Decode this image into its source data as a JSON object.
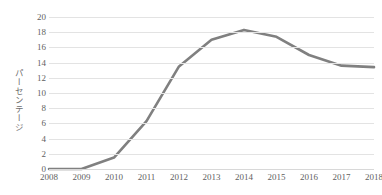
{
  "chart_data": {
    "type": "line",
    "title": "",
    "subtitle": "",
    "xlabel": "",
    "ylabel": "パーセンテージ",
    "x": [
      2008,
      2009,
      2010,
      2011,
      2012,
      2013,
      2014,
      2015,
      2016,
      2017,
      2018
    ],
    "categories": [
      "2008",
      "2009",
      "2010",
      "2011",
      "2012",
      "2013",
      "2014",
      "2015",
      "2016",
      "2017",
      "2018"
    ],
    "values": [
      0.0,
      0.0,
      1.5,
      6.3,
      13.5,
      17.0,
      18.3,
      17.4,
      15.0,
      13.6,
      13.4
    ],
    "series": [
      {
        "name": "パーセンテージ",
        "color": "#808080",
        "values": [
          0.0,
          0.0,
          1.5,
          6.3,
          13.5,
          17.0,
          18.3,
          17.4,
          15.0,
          13.6,
          13.4
        ]
      }
    ],
    "ylim": [
      0,
      20
    ],
    "ytick_step": 2,
    "ytick_labels": [
      "0",
      "2",
      "4",
      "6",
      "8",
      "10",
      "12",
      "14",
      "16",
      "18",
      "20"
    ],
    "ytick_values": [
      0,
      2,
      4,
      6,
      8,
      10,
      12,
      14,
      16,
      18,
      20
    ],
    "xtick_labels": [
      "2008",
      "2009",
      "2010",
      "2011",
      "2012",
      "2013",
      "2014",
      "2015",
      "2016",
      "2017",
      "2018"
    ],
    "grid": "horizontal",
    "grid_color": "#e3e3e3",
    "legend": "none",
    "background": "#ffffff",
    "line_color": "#808080",
    "line_width": 2.6,
    "markers": "none",
    "annotations": []
  }
}
